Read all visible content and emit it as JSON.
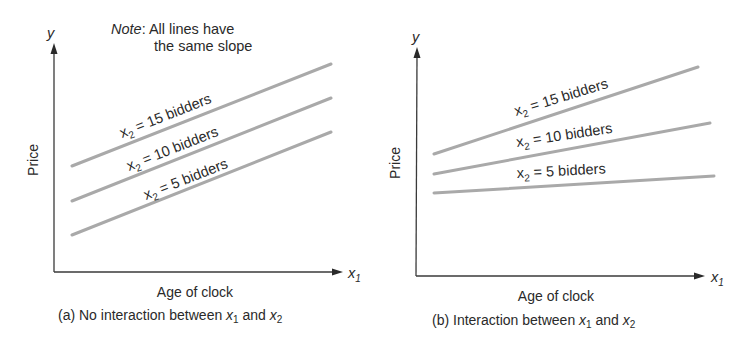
{
  "figure": {
    "note_prefix": "Note",
    "note_line1": ": All lines have",
    "note_line2": "the same slope"
  },
  "chart_data": [
    {
      "type": "line",
      "panel": "a",
      "title": "(a) No interaction between x1 and x2",
      "caption_parts": {
        "prefix": "(a) No interaction between ",
        "x1": "x",
        "x1_sub": "1",
        "mid": " and ",
        "x2": "x",
        "x2_sub": "2"
      },
      "xlabel": "Age of clock",
      "ylabel": "Price",
      "x_axis_symbol": "x",
      "x_axis_sub": "1",
      "y_axis_symbol": "y",
      "grid": false,
      "ticks": false,
      "axes_px": {
        "origin": [
          54,
          272
        ],
        "x_end": [
          343,
          272
        ],
        "y_end": [
          54,
          43
        ]
      },
      "series": [
        {
          "name": "x2 = 15 bidders",
          "label_sym": "x",
          "label_sub": "2",
          "label_rest": " = 15 bidders",
          "px": [
            [
              72,
              166
            ],
            [
              331,
              64
            ]
          ],
          "label_px": [
            122,
            138
          ],
          "angle": -21.5,
          "color": "#a9a9a9"
        },
        {
          "name": "x2 = 10 bidders",
          "label_sym": "x",
          "label_sub": "2",
          "label_rest": " = 10 bidders",
          "px": [
            [
              72,
              201
            ],
            [
              331,
              98
            ]
          ],
          "label_px": [
            129,
            171
          ],
          "angle": -21.5,
          "color": "#a9a9a9"
        },
        {
          "name": "x2 = 5 bidders",
          "label_sym": "x",
          "label_sub": "2",
          "label_rest": " = 5 bidders",
          "px": [
            [
              72,
              235
            ],
            [
              331,
              132
            ]
          ],
          "label_px": [
            146,
            200
          ],
          "angle": -21.5,
          "color": "#a9a9a9"
        }
      ],
      "annotation": "Note: All lines have the same slope"
    },
    {
      "type": "line",
      "panel": "b",
      "title": "(b) Interaction between x1 and x2",
      "caption_parts": {
        "prefix": "(b) Interaction between ",
        "x1": "x",
        "x1_sub": "1",
        "mid": " and ",
        "x2": "x",
        "x2_sub": "2"
      },
      "xlabel": "Age of clock",
      "ylabel": "Price",
      "x_axis_symbol": "x",
      "x_axis_sub": "1",
      "y_axis_symbol": "y",
      "grid": false,
      "ticks": false,
      "axes_px": {
        "origin": [
          416,
          276
        ],
        "x_end": [
          705,
          276
        ],
        "y_end": [
          417,
          47
        ]
      },
      "series": [
        {
          "name": "x2 = 15 bidders",
          "label_sym": "x",
          "label_sub": "2",
          "label_rest": " = 15 bidders",
          "px": [
            [
              434,
              154
            ],
            [
              698,
              67
            ]
          ],
          "label_px": [
            516,
            116
          ],
          "angle": -17,
          "color": "#a9a9a9"
        },
        {
          "name": "x2 = 10 bidders",
          "label_sym": "x",
          "label_sub": "2",
          "label_rest": " = 10 bidders",
          "px": [
            [
              434,
              174
            ],
            [
              710,
              123
            ]
          ],
          "label_px": [
            517,
            147
          ],
          "angle": -8.5,
          "color": "#a9a9a9"
        },
        {
          "name": "x2 = 5 bidders",
          "label_sym": "x",
          "label_sub": "2",
          "label_rest": " = 5 bidders",
          "px": [
            [
              434,
              193
            ],
            [
              714,
              176
            ]
          ],
          "label_px": [
            517,
            178
          ],
          "angle": -3,
          "color": "#a9a9a9"
        }
      ]
    }
  ]
}
